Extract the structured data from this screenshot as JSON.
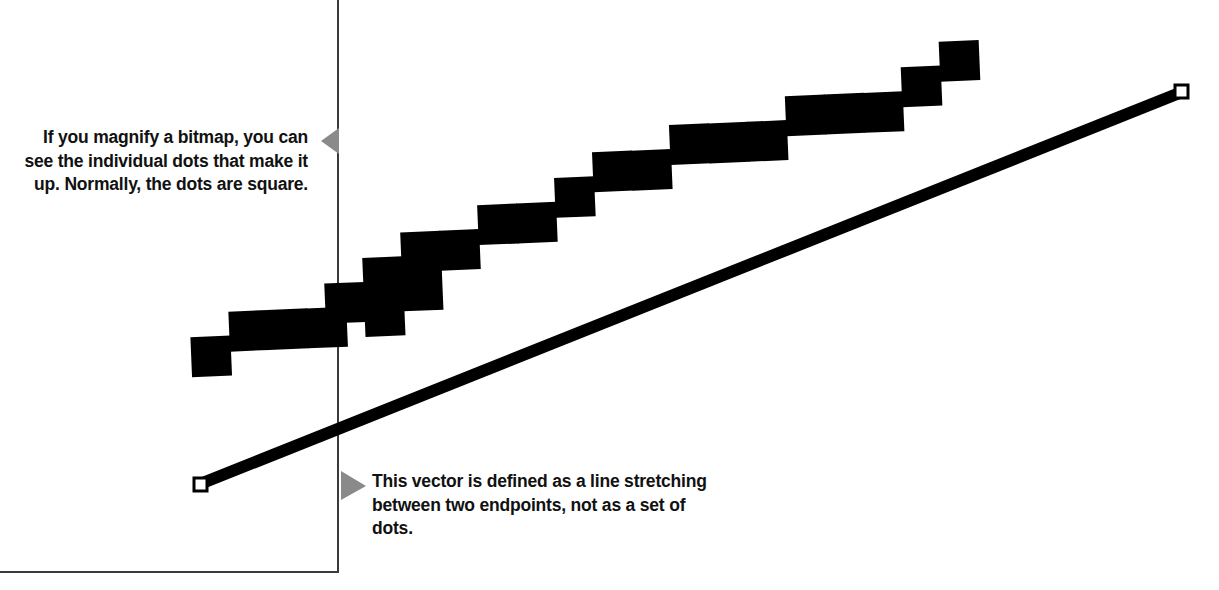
{
  "figure": {
    "background_color": "#ffffff",
    "ink_color": "#000000",
    "frame_line_color": "#3a3a3a",
    "pointer_color": "#8a8a8a",
    "width": 1219,
    "height": 590
  },
  "captions": {
    "bitmap": {
      "text": "If you magnify a bitmap, you can see the individual dots that make it up. Normally, the dots are square.",
      "align": "right",
      "pointer": "triangle-left"
    },
    "vector": {
      "text": "This vector is defined as a line stretching between two endpoints, not as a set of dots.",
      "align": "left",
      "pointer": "triangle-right"
    }
  },
  "frame": {
    "vertical_rule": {
      "x": 338,
      "y1": 0,
      "y2": 573
    },
    "horizontal_rule": {
      "y": 572,
      "x1": 0,
      "x2": 338
    }
  },
  "bitmap_staircase": {
    "description": "Magnified bitmap line rendered as a staircase of large square dots",
    "dot_size": 39,
    "rotation_degrees": -2.4,
    "dot_count": 26,
    "dots": [
      [
        191,
        313
      ],
      [
        229,
        311
      ],
      [
        229,
        289
      ],
      [
        267,
        287
      ],
      [
        305,
        285
      ],
      [
        305,
        263
      ],
      [
        324,
        272
      ],
      [
        324,
        250
      ],
      [
        343,
        259
      ],
      [
        362,
        236
      ],
      [
        362,
        214
      ],
      [
        400,
        212
      ],
      [
        419,
        221
      ],
      [
        419,
        199
      ],
      [
        438,
        186
      ],
      [
        457,
        174
      ],
      [
        495,
        172
      ],
      [
        533,
        170
      ],
      [
        533,
        148
      ],
      [
        571,
        146
      ],
      [
        609,
        144
      ],
      [
        628,
        122
      ],
      [
        666,
        120
      ],
      [
        704,
        110
      ],
      [
        742,
        98
      ],
      [
        780,
        86
      ],
      [
        818,
        74
      ],
      [
        856,
        62
      ],
      [
        875,
        50
      ],
      [
        898,
        32
      ]
    ]
  },
  "vector_line": {
    "description": "Smooth vector line with two endpoint handles",
    "start": {
      "x": 200,
      "y": 484
    },
    "end": {
      "x": 1182,
      "y": 92
    },
    "thickness": 12,
    "endpoint_handle": {
      "shape": "hollow-square",
      "size": 12,
      "fill": "#ffffff",
      "stroke": "#000000"
    }
  },
  "pointers": [
    {
      "name": "bitmap-pointer",
      "direction": "left",
      "x": 322,
      "y": 128,
      "width": 17,
      "height": 26
    },
    {
      "name": "vector-pointer",
      "direction": "right",
      "x": 341,
      "y": 471,
      "width": 24,
      "height": 29
    }
  ]
}
